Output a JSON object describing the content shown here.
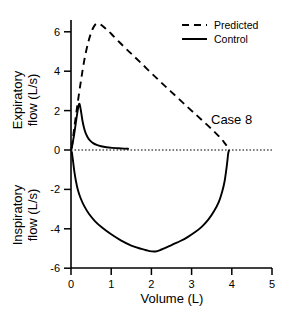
{
  "chart_data": {
    "type": "line",
    "title": "",
    "annotation": "Case 8",
    "xlabel": "Volume (L)",
    "ylabel_top": "Expiratory flow (L/s)",
    "ylabel_bottom": "Inspiratory flow (L/s)",
    "ylabel_top_line1": "Expiratory",
    "ylabel_top_line2": "flow (L/s)",
    "ylabel_bottom_line1": "Inspiratory",
    "ylabel_bottom_line2": "flow (L/s)",
    "xlim": [
      0,
      5
    ],
    "ylim": [
      -6,
      7
    ],
    "xticks": [
      0,
      1,
      2,
      3,
      4,
      5
    ],
    "xticklabels": [
      "0",
      "1",
      "2",
      "3",
      "4",
      "5"
    ],
    "yticks": [
      -6,
      -4,
      -2,
      0,
      2,
      4,
      6
    ],
    "yticklabels": [
      "-6",
      "-4",
      "-2",
      "0",
      "2",
      "4",
      "6"
    ],
    "grid": false,
    "zero_line": true,
    "legend_position": "top-right",
    "legend": [
      {
        "name": "Predicted",
        "style": "dashed",
        "color": "#000000"
      },
      {
        "name": "Control",
        "style": "solid",
        "color": "#000000"
      }
    ],
    "series": [
      {
        "name": "Predicted",
        "style": "dashed",
        "color": "#000000",
        "points": [
          [
            0.02,
            0.1
          ],
          [
            0.08,
            1.1
          ],
          [
            0.16,
            2.3
          ],
          [
            0.25,
            3.55
          ],
          [
            0.33,
            4.55
          ],
          [
            0.42,
            5.4
          ],
          [
            0.5,
            5.95
          ],
          [
            0.58,
            6.3
          ],
          [
            0.66,
            6.42
          ],
          [
            0.75,
            6.35
          ],
          [
            0.85,
            6.18
          ],
          [
            1.0,
            5.9
          ],
          [
            1.2,
            5.48
          ],
          [
            1.45,
            4.98
          ],
          [
            1.7,
            4.5
          ],
          [
            2.0,
            3.9
          ],
          [
            2.3,
            3.32
          ],
          [
            2.6,
            2.75
          ],
          [
            2.9,
            2.18
          ],
          [
            3.15,
            1.72
          ],
          [
            3.4,
            1.25
          ],
          [
            3.6,
            0.86
          ],
          [
            3.75,
            0.54
          ],
          [
            3.86,
            0.25
          ],
          [
            3.95,
            0.04
          ]
        ]
      },
      {
        "name": "Control",
        "style": "solid",
        "color": "#000000",
        "segments": [
          {
            "label": "expiratory-limb",
            "points": [
              [
                0.01,
                0.05
              ],
              [
                0.05,
                0.45
              ],
              [
                0.09,
                0.95
              ],
              [
                0.13,
                1.52
              ],
              [
                0.17,
                2.05
              ],
              [
                0.2,
                2.33
              ],
              [
                0.22,
                2.28
              ],
              [
                0.25,
                1.95
              ],
              [
                0.28,
                1.55
              ],
              [
                0.32,
                1.15
              ],
              [
                0.36,
                0.88
              ],
              [
                0.41,
                0.66
              ],
              [
                0.47,
                0.49
              ],
              [
                0.55,
                0.35
              ],
              [
                0.64,
                0.26
              ],
              [
                0.75,
                0.19
              ],
              [
                0.88,
                0.14
              ],
              [
                1.02,
                0.11
              ],
              [
                1.18,
                0.09
              ],
              [
                1.32,
                0.07
              ],
              [
                1.42,
                0.06
              ]
            ]
          },
          {
            "label": "inspiratory-limb",
            "points": [
              [
                0.02,
                -0.1
              ],
              [
                0.05,
                -0.55
              ],
              [
                0.08,
                -1.05
              ],
              [
                0.12,
                -1.55
              ],
              [
                0.17,
                -2.02
              ],
              [
                0.24,
                -2.45
              ],
              [
                0.33,
                -2.85
              ],
              [
                0.45,
                -3.25
              ],
              [
                0.6,
                -3.62
              ],
              [
                0.78,
                -3.95
              ],
              [
                1.0,
                -4.28
              ],
              [
                1.25,
                -4.6
              ],
              [
                1.5,
                -4.85
              ],
              [
                1.75,
                -5.02
              ],
              [
                1.95,
                -5.13
              ],
              [
                2.1,
                -5.15
              ],
              [
                2.25,
                -5.05
              ],
              [
                2.4,
                -4.92
              ],
              [
                2.55,
                -4.78
              ],
              [
                2.72,
                -4.62
              ],
              [
                2.9,
                -4.42
              ],
              [
                3.08,
                -4.18
              ],
              [
                3.25,
                -3.9
              ],
              [
                3.42,
                -3.52
              ],
              [
                3.56,
                -3.1
              ],
              [
                3.68,
                -2.62
              ],
              [
                3.76,
                -2.12
              ],
              [
                3.82,
                -1.6
              ],
              [
                3.86,
                -1.05
              ],
              [
                3.89,
                -0.55
              ],
              [
                3.91,
                -0.18
              ],
              [
                3.93,
                -0.02
              ]
            ]
          }
        ]
      }
    ]
  },
  "axes_geometry": {
    "plot_left_px": 71,
    "plot_right_px": 272,
    "zero_y_px": 150,
    "y_per_unit_px": 19.7,
    "x_per_unit_px": 40.2
  }
}
